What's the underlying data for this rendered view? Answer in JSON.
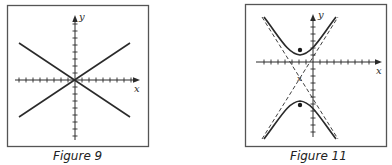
{
  "figures": [
    {
      "id": "figure-9",
      "caption": "Figure 9",
      "axis_labels": {
        "x": "x",
        "y": "y"
      },
      "description": "Pair of lines crossing at origin (degenerate hyperbola / asymptote pair)",
      "lines": [
        {
          "from": [
            -7.5,
            5
          ],
          "to": [
            7.5,
            -5
          ]
        },
        {
          "from": [
            -7.5,
            -5
          ],
          "to": [
            7.5,
            5
          ]
        }
      ]
    },
    {
      "id": "figure-11",
      "caption": "Figure 11",
      "axis_labels": {
        "x": "x",
        "y": "y"
      },
      "description": "Vertical hyperbola with center marked x, foci marked as dots, dashed asymptotes",
      "center_marker": "x",
      "foci": "dots"
    }
  ],
  "colors": {
    "ink": "#2a2a2a",
    "frame": "#555555",
    "background": "#ffffff"
  }
}
